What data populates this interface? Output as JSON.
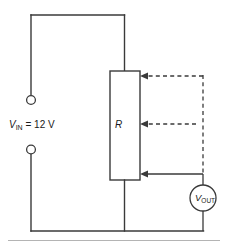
{
  "figure": {
    "type": "circuit-diagram",
    "colors": {
      "wire": "#3a3a3a",
      "background": "#ffffff",
      "baseline": "#b4b4b4",
      "text": "#1a1a1a"
    }
  },
  "source": {
    "label_symbol": "V",
    "label_subscript": "IN",
    "label_equals_value": " = 12 V",
    "full_label": "VIN = 12 V",
    "terminal_top_name": "positive-terminal",
    "terminal_bottom_name": "negative-terminal"
  },
  "resistor": {
    "label": "R"
  },
  "meter": {
    "label_symbol": "V",
    "label_subscript": "OUT",
    "full_label": "VOUT"
  },
  "wiper": {
    "arrow_top": "wiper-position-top",
    "arrow_middle": "wiper-position-middle",
    "arrow_bottom": "wiper-position-bottom"
  }
}
